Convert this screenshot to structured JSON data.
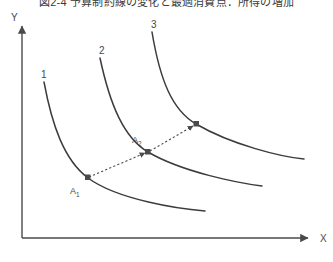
{
  "figure": {
    "title": "図2-4 予算制約線の変化と最適消費点：所得の増加",
    "background_color": "#ffffff",
    "line_color": "#3c3c3c",
    "axis_color": "#4a4a4a"
  },
  "axes": {
    "y_label": "Y",
    "x_label": "X",
    "origin": {
      "x": 22,
      "y": 238
    },
    "y_top": {
      "x": 22,
      "y": 22
    },
    "x_right": {
      "x": 312,
      "y": 238
    },
    "y_label_pos": {
      "x": 14,
      "y": 18
    },
    "x_label_pos": {
      "x": 322,
      "y": 241
    }
  },
  "curves": [
    {
      "label": "1",
      "label_pos": {
        "x": 44,
        "y": 75
      },
      "path": "M 44,82 C 52,125 64,160 88,178 C 118,200 180,209 205,211",
      "start": {
        "x": 44,
        "y": 82
      },
      "end": {
        "x": 205,
        "y": 211
      }
    },
    {
      "label": "2",
      "label_pos": {
        "x": 102,
        "y": 51
      },
      "path": "M 100,58 C 110,105 124,138 148,152 C 182,172 238,183 262,186",
      "start": {
        "x": 100,
        "y": 58
      },
      "end": {
        "x": 262,
        "y": 186
      }
    },
    {
      "label": "3",
      "label_pos": {
        "x": 150,
        "y": 25
      },
      "path": "M 152,32 C 160,80 172,110 196,124 C 232,145 282,157 304,159",
      "start": {
        "x": 152,
        "y": 32
      },
      "end": {
        "x": 304,
        "y": 159
      }
    }
  ],
  "expansion_path": {
    "dashed": true,
    "from": {
      "x": 88,
      "y": 178
    },
    "via": {
      "x": 148,
      "y": 152
    },
    "to": {
      "x": 196,
      "y": 124
    },
    "points": [
      {
        "label": "A",
        "subscript": "1",
        "x": 88,
        "y": 178,
        "label_pos": {
          "x": 72,
          "y": 192
        }
      },
      {
        "label": "A",
        "subscript": "2",
        "x": 148,
        "y": 152,
        "label_pos": {
          "x": 134,
          "y": 142
        }
      }
    ]
  },
  "chart_data": {
    "type": "line",
    "title": "図2-4 予算制約線の変化と最適消費点：所得の増加",
    "xlabel": "X",
    "ylabel": "Y",
    "grid": false,
    "legend": "none",
    "series": [
      {
        "name": "1",
        "note": "innermost convex indifference curve"
      },
      {
        "name": "2",
        "note": "middle convex indifference curve"
      },
      {
        "name": "3",
        "note": "outermost convex indifference curve"
      }
    ],
    "annotations": [
      "A1",
      "A2"
    ]
  }
}
